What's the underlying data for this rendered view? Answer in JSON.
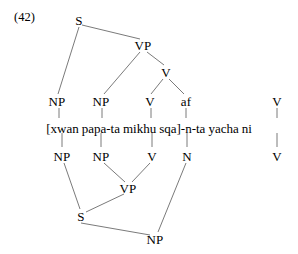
{
  "figure": {
    "example_number": "(42)",
    "type": "syntax-tree",
    "language_gloss_line": "[xwan papa-ta mikhu sqa]-n-ta yacha ni",
    "line_color": "#6b6b6b",
    "text_color": "#000000",
    "background_color": "#ffffff"
  },
  "words": [
    {
      "text": "[xwan",
      "x": 61
    },
    {
      "text": "papa-ta",
      "x": 103
    },
    {
      "text": "mikhu",
      "x": 152
    },
    {
      "text": "sqa]-n-ta",
      "x": 197
    },
    {
      "text": "yacha",
      "x": 247
    },
    {
      "text": "ni",
      "x": 278
    }
  ],
  "upper_nodes": [
    {
      "label": "S",
      "x": 79,
      "y": 20
    },
    {
      "label": "VP",
      "x": 143,
      "y": 45
    },
    {
      "label": "V",
      "x": 166,
      "y": 72
    },
    {
      "label": "NP",
      "x": 57,
      "y": 101
    },
    {
      "label": "NP",
      "x": 101,
      "y": 101
    },
    {
      "label": "V",
      "x": 150,
      "y": 101
    },
    {
      "label": "af",
      "x": 186,
      "y": 101
    },
    {
      "label": "V",
      "x": 277,
      "y": 101
    }
  ],
  "lower_nodes": [
    {
      "label": "NP",
      "x": 62,
      "y": 156
    },
    {
      "label": "NP",
      "x": 101,
      "y": 156
    },
    {
      "label": "V",
      "x": 152,
      "y": 156
    },
    {
      "label": "N",
      "x": 187,
      "y": 156
    },
    {
      "label": "V",
      "x": 277,
      "y": 156
    },
    {
      "label": "VP",
      "x": 128,
      "y": 188
    },
    {
      "label": "S",
      "x": 81,
      "y": 216
    },
    {
      "label": "NP",
      "x": 155,
      "y": 239
    }
  ],
  "upper_edges": [
    {
      "from": "S",
      "to": "NP-left",
      "x1": 79,
      "y1": 27,
      "x2": 58,
      "y2": 94
    },
    {
      "from": "S",
      "to": "VP",
      "x1": 82,
      "y1": 25,
      "x2": 140,
      "y2": 39
    },
    {
      "from": "VP",
      "to": "NP-2",
      "x1": 140,
      "y1": 52,
      "x2": 104,
      "y2": 94
    },
    {
      "from": "VP",
      "to": "V-upper",
      "x1": 147,
      "y1": 52,
      "x2": 164,
      "y2": 65
    },
    {
      "from": "V-upper",
      "to": "V",
      "x1": 163,
      "y1": 79,
      "x2": 151,
      "y2": 94
    },
    {
      "from": "V-upper",
      "to": "af",
      "x1": 169,
      "y1": 79,
      "x2": 184,
      "y2": 94
    }
  ],
  "upper_ticks": [
    {
      "x": 59,
      "y1": 108,
      "y2": 118
    },
    {
      "x": 102,
      "y1": 108,
      "y2": 118
    },
    {
      "x": 151,
      "y1": 108,
      "y2": 118
    },
    {
      "x": 186,
      "y1": 108,
      "y2": 118
    },
    {
      "x": 277,
      "y1": 108,
      "y2": 118
    }
  ],
  "lower_ticks": [
    {
      "x": 62,
      "y1": 133,
      "y2": 147
    },
    {
      "x": 101,
      "y1": 133,
      "y2": 147
    },
    {
      "x": 152,
      "y1": 133,
      "y2": 147
    },
    {
      "x": 187,
      "y1": 133,
      "y2": 147
    },
    {
      "x": 277,
      "y1": 133,
      "y2": 147
    }
  ],
  "lower_edges": [
    {
      "from": "NP-2",
      "to": "VP-low",
      "x1": 104,
      "y1": 163,
      "x2": 125,
      "y2": 182
    },
    {
      "from": "V-low",
      "to": "VP-low",
      "x1": 150,
      "y1": 163,
      "x2": 132,
      "y2": 182
    },
    {
      "from": "NP-1",
      "to": "S-low",
      "x1": 64,
      "y1": 163,
      "x2": 80,
      "y2": 209
    },
    {
      "from": "VP-low",
      "to": "S-low",
      "x1": 124,
      "y1": 194,
      "x2": 86,
      "y2": 212
    },
    {
      "from": "S-low",
      "to": "NP-bot",
      "x1": 81,
      "y1": 223,
      "x2": 150,
      "y2": 235
    },
    {
      "from": "N",
      "to": "NP-bot",
      "x1": 186,
      "y1": 163,
      "x2": 158,
      "y2": 232
    }
  ]
}
